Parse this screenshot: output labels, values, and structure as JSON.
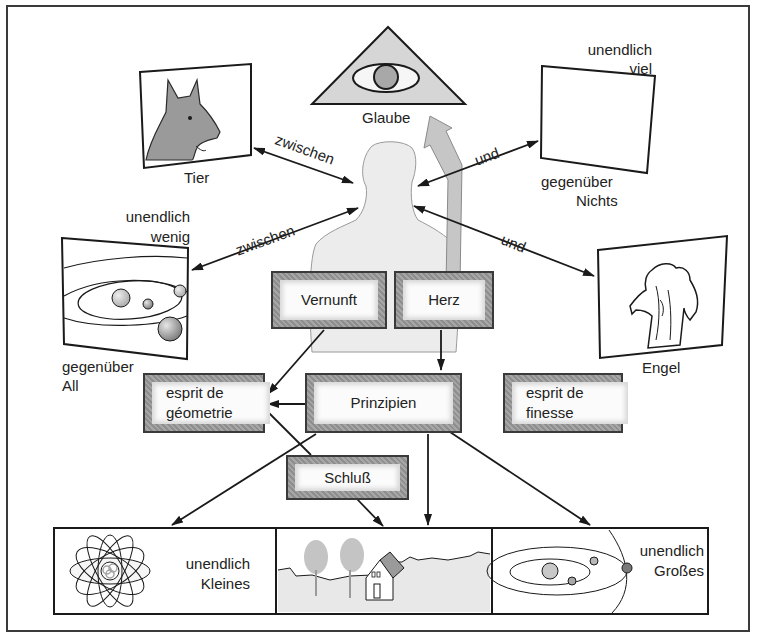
{
  "diagram": {
    "type": "concept-diagram",
    "language": "de",
    "center_figure": "human-silhouette",
    "top": {
      "symbol": "eye-in-triangle",
      "label": "Glaube"
    },
    "pictures": {
      "tier": {
        "label": "Tier"
      },
      "nichts": {
        "label_above_1": "unendlich",
        "label_above_2": "viel",
        "label_below_1": "gegenüber",
        "label_below_2": "Nichts"
      },
      "all": {
        "label_above_1": "unendlich",
        "label_above_2": "wenig",
        "label_below_1": "gegenüber",
        "label_below_2": "All"
      },
      "engel": {
        "label": "Engel"
      }
    },
    "connectors": {
      "tier_human": "zwischen",
      "all_human": "zwischen",
      "nichts_human": "und",
      "engel_human": "und"
    },
    "boxes": {
      "vernunft": "Vernunft",
      "herz": "Herz",
      "prinzipien": "Prinzipien",
      "esprit_geometrie_1": "esprit de",
      "esprit_geometrie_2": "géometrie",
      "esprit_finesse_1": "esprit de",
      "esprit_finesse_2": "finesse",
      "schluss": "Schluß"
    },
    "bottom_panels": {
      "small": {
        "line1": "unendlich",
        "line2": "Kleines",
        "image": "atom"
      },
      "middle": {
        "image": "landscape-house-trees"
      },
      "large": {
        "line1": "unendlich",
        "line2": "Großes",
        "image": "solar-system"
      }
    },
    "edges": [
      {
        "from": "Tier",
        "to": "Mensch",
        "label": "zwischen",
        "style": "double-arrow"
      },
      {
        "from": "All",
        "to": "Mensch",
        "label": "zwischen",
        "style": "double-arrow"
      },
      {
        "from": "Nichts",
        "to": "Mensch",
        "label": "und",
        "style": "double-arrow"
      },
      {
        "from": "Engel",
        "to": "Mensch",
        "label": "und",
        "style": "double-arrow"
      },
      {
        "from": "Herz",
        "to": "Glaube",
        "style": "broad-gray-arrow"
      },
      {
        "from": "Vernunft",
        "to": "esprit de géometrie",
        "style": "arrow"
      },
      {
        "from": "Herz",
        "to": "Prinzipien",
        "style": "arrow"
      },
      {
        "from": "Prinzipien",
        "to": "esprit de géometrie",
        "style": "arrow"
      },
      {
        "from": "esprit de géometrie",
        "to": "Schluß",
        "style": "line"
      },
      {
        "from": "Schluß",
        "to": "landscape",
        "style": "arrow"
      },
      {
        "from": "Prinzipien",
        "to": "unendlich Kleines",
        "style": "arrow"
      },
      {
        "from": "Prinzipien",
        "to": "landscape",
        "style": "arrow"
      },
      {
        "from": "Prinzipien",
        "to": "unendlich Großes",
        "style": "arrow"
      }
    ],
    "colors": {
      "line": "#1a1a1a",
      "figure_fill": "#e9e9e9",
      "triangle_fill": "#d4d4d4",
      "box_border_fill": "#9a9a9a",
      "box_inner": "#fbfbfb",
      "broad_arrow": "#c4c4c4"
    }
  }
}
